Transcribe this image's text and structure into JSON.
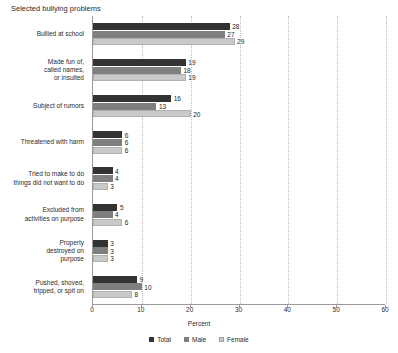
{
  "chart_data": {
    "type": "bar",
    "title": "Selected bullying problems",
    "xlabel": "Percent",
    "ylabel": "",
    "orientation": "horizontal",
    "xlim": [
      0,
      60
    ],
    "xticks": [
      0,
      10,
      20,
      30,
      40,
      50,
      60
    ],
    "grid": "vertical-dotted",
    "legend_position": "bottom-center",
    "categories": [
      "Bullied at school",
      "Made fun of, called names, or insulted",
      "Subject of rumors",
      "Threatened with harm",
      "Tried to make to do things did not want to do",
      "Excluded from activities on purpose",
      "Property destroyed on purpose",
      "Pushed, shoved, tripped, or spit on"
    ],
    "category_label_lines": [
      [
        "Bullied at school"
      ],
      [
        "Made fun of,",
        "called names,",
        "or insulted"
      ],
      [
        "Subject of rumors"
      ],
      [
        "Threatened with harm"
      ],
      [
        "Tried to make to do",
        "things did not want to do"
      ],
      [
        "Excluded from",
        "activities on purpose"
      ],
      [
        "Property",
        "destroyed on",
        "purpose"
      ],
      [
        "Pushed, shoved,",
        "tripped, or spit on"
      ]
    ],
    "series": [
      {
        "name": "Total",
        "color": "#333333",
        "values": [
          28,
          19,
          16,
          6,
          4,
          5,
          3,
          9
        ]
      },
      {
        "name": "Male",
        "color": "#7f7f7f",
        "values": [
          27,
          18,
          13,
          6,
          4,
          4,
          3,
          10
        ]
      },
      {
        "name": "Female",
        "color": "#c9c9c9",
        "values": [
          29,
          19,
          20,
          6,
          3,
          6,
          3,
          8
        ]
      }
    ]
  },
  "legend": {
    "items": [
      {
        "label": "Total"
      },
      {
        "label": "Male"
      },
      {
        "label": "Female"
      }
    ]
  }
}
